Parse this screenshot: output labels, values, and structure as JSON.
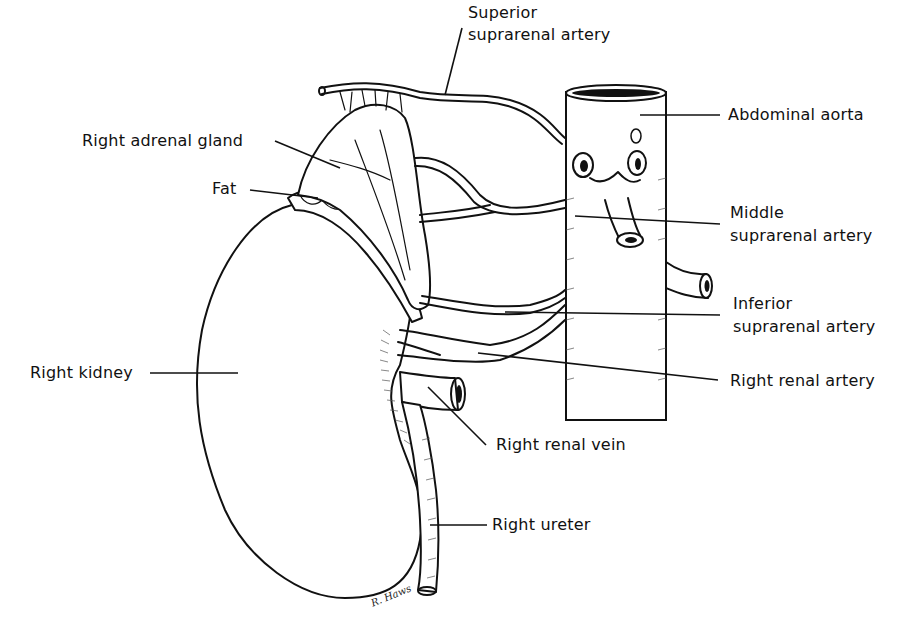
{
  "diagram": {
    "labels": {
      "superior_suprarenal_artery": {
        "line1": "Superior",
        "line2": "suprarenal artery"
      },
      "abdominal_aorta": "Abdominal aorta",
      "right_adrenal_gland": "Right adrenal gland",
      "fat": "Fat",
      "middle_suprarenal_artery": {
        "line1": "Middle",
        "line2": "suprarenal artery"
      },
      "inferior_suprarenal_artery": {
        "line1": "Inferior",
        "line2": "suprarenal artery"
      },
      "right_kidney": "Right kidney",
      "right_renal_artery": "Right renal artery",
      "right_renal_vein": "Right renal vein",
      "right_ureter": "Right ureter"
    },
    "signature": "R. Haws",
    "colors": {
      "ink": "#111111",
      "background": "#ffffff"
    }
  }
}
